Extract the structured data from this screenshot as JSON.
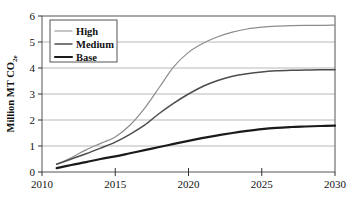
{
  "chart_data": {
    "type": "line",
    "title": "",
    "xlabel": "",
    "ylabel_main": "Million MT CO",
    "ylabel_sub": "2e",
    "ylabel_full": "Million MT CO2e",
    "xlim": [
      2010,
      2030
    ],
    "ylim": [
      0,
      6
    ],
    "x_ticks": [
      "2010",
      "2015",
      "2020",
      "2025",
      "2030"
    ],
    "x_tick_values": [
      2010,
      2015,
      2020,
      2025,
      2030
    ],
    "y_ticks": [
      "0",
      "1",
      "2",
      "3",
      "4",
      "5",
      "6"
    ],
    "y_tick_values": [
      0,
      1,
      2,
      3,
      4,
      5,
      6
    ],
    "grid": true,
    "grid_axis": "y",
    "legend_position": "top-left",
    "x": [
      2011,
      2012,
      2013,
      2014,
      2015,
      2016,
      2017,
      2018,
      2019,
      2020,
      2021,
      2022,
      2023,
      2024,
      2025,
      2026,
      2027,
      2028,
      2029,
      2030
    ],
    "series": [
      {
        "name": "High",
        "color": "#8c8c8c",
        "width": 1.2,
        "values": [
          0.3,
          0.55,
          0.85,
          1.1,
          1.35,
          1.8,
          2.45,
          3.25,
          4.05,
          4.6,
          4.95,
          5.2,
          5.38,
          5.5,
          5.57,
          5.61,
          5.63,
          5.64,
          5.64,
          5.65
        ]
      },
      {
        "name": "Medium",
        "color": "#4d4d4d",
        "width": 1.5,
        "values": [
          0.3,
          0.5,
          0.7,
          0.92,
          1.15,
          1.45,
          1.8,
          2.25,
          2.65,
          3.0,
          3.3,
          3.52,
          3.68,
          3.78,
          3.85,
          3.89,
          3.91,
          3.92,
          3.93,
          3.93
        ]
      },
      {
        "name": "Base",
        "color": "#1a1a1a",
        "width": 2.2,
        "values": [
          0.15,
          0.27,
          0.38,
          0.5,
          0.6,
          0.72,
          0.84,
          0.96,
          1.08,
          1.2,
          1.31,
          1.41,
          1.5,
          1.58,
          1.65,
          1.7,
          1.73,
          1.75,
          1.77,
          1.78
        ]
      }
    ]
  },
  "legend": {
    "items": [
      {
        "label": "High"
      },
      {
        "label": "Medium"
      },
      {
        "label": "Base"
      }
    ]
  }
}
